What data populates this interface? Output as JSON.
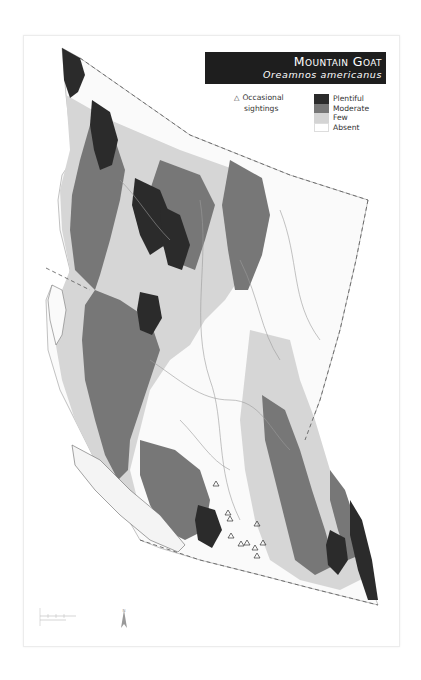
{
  "title": {
    "common_name": "Mountain Goat",
    "scientific_name": "Oreamnos americanus"
  },
  "legend": {
    "symbol_items": [
      {
        "icon": "triangle-outline-icon",
        "label_line1": "Occasional",
        "label_line2": "sightings"
      }
    ],
    "abundance_items": [
      {
        "label": "Plentiful",
        "color": "#2b2b2b"
      },
      {
        "label": "Moderate",
        "color": "#777777"
      },
      {
        "label": "Few",
        "color": "#d4d4d4"
      },
      {
        "label": "Absent",
        "color": "#ffffff"
      }
    ]
  },
  "map": {
    "region": "British Columbia",
    "boundary_style": "dashed",
    "colors": {
      "plentiful": "#2b2b2b",
      "moderate": "#777777",
      "few": "#d6d6d6",
      "absent": "#ffffff",
      "rivers": "#9a9a9a",
      "boundary": "#555555"
    }
  },
  "scale": {
    "icon": "scale-bar-icon"
  },
  "north_arrow": {
    "icon": "north-arrow-icon"
  }
}
